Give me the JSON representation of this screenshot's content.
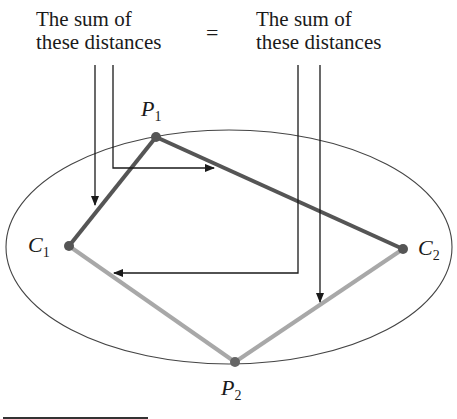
{
  "captions": {
    "left": {
      "line1": "The sum of",
      "line2": "these distances"
    },
    "equals": "=",
    "right": {
      "line1": "The sum of",
      "line2": "these distances"
    }
  },
  "points": {
    "P1": {
      "letter": "P",
      "sub": "1"
    },
    "P2": {
      "letter": "P",
      "sub": "2"
    },
    "C1": {
      "letter": "C",
      "sub": "1"
    },
    "C2": {
      "letter": "C",
      "sub": "2"
    }
  },
  "colors": {
    "dark_segment": "#555555",
    "light_segment": "#a8a8a8",
    "ellipse": "#444444",
    "arrow": "#1a1a1a"
  }
}
